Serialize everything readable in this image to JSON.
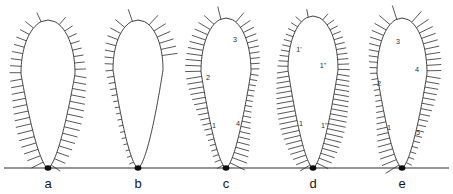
{
  "figure": {
    "width": 453,
    "height": 194,
    "background_color": "#ffffff",
    "line_color": "#2a2a2a",
    "bristle_color": "#3a3a3a",
    "baseline_color": "#2b2b2b",
    "apex_dot_color": "#0d0d0d",
    "baseline": {
      "y": 168,
      "x_start": 4,
      "x_end": 449
    }
  },
  "panels": [
    {
      "id": "a",
      "letter": "a",
      "letter_x": 48,
      "letter_y": 188,
      "apex_x": 48,
      "apex_y": 168,
      "top_y": 20,
      "max_half_width": 27,
      "belly_y": 74,
      "bristle_count": 46,
      "bristle_start_t": 0.02,
      "bristle_end_t": 0.99,
      "bristle_len_min": 9,
      "bristle_len_max": 15,
      "labels": []
    },
    {
      "id": "b",
      "letter": "b",
      "letter_x": 138,
      "letter_y": 188,
      "apex_x": 138,
      "apex_y": 168,
      "top_y": 20,
      "max_half_width": 25,
      "belly_y": 70,
      "bristle_count": 30,
      "bristle_start_t": 0.02,
      "bristle_end_t": 0.62,
      "bristle_len_min": 6,
      "bristle_len_max": 16,
      "labels": []
    },
    {
      "id": "c",
      "letter": "c",
      "letter_x": 226,
      "letter_y": 188,
      "apex_x": 226,
      "apex_y": 168,
      "top_y": 18,
      "max_half_width": 25,
      "belly_y": 72,
      "bristle_count": 58,
      "bristle_start_t": 0.01,
      "bristle_end_t": 1.0,
      "bristle_len_min": 7,
      "bristle_len_max": 16,
      "labels": [
        {
          "text": "1",
          "x": 214,
          "y": 128
        },
        {
          "text": "2",
          "x": 208,
          "y": 80
        },
        {
          "text": "3",
          "x": 235,
          "y": 42
        },
        {
          "text": "4",
          "x": 238,
          "y": 126
        }
      ]
    },
    {
      "id": "d",
      "letter": "d",
      "letter_x": 313,
      "letter_y": 188,
      "apex_x": 313,
      "apex_y": 168,
      "top_y": 16,
      "max_half_width": 25,
      "belly_y": 70,
      "bristle_count": 62,
      "bristle_start_t": 0.01,
      "bristle_end_t": 1.0,
      "bristle_len_min": 7,
      "bristle_len_max": 17,
      "labels": [
        {
          "text": "1",
          "x": 301,
          "y": 126
        },
        {
          "text": "1'",
          "x": 299,
          "y": 52
        },
        {
          "text": "1''",
          "x": 323,
          "y": 68
        },
        {
          "text": "1'''",
          "x": 325,
          "y": 128
        }
      ]
    },
    {
      "id": "e",
      "letter": "e",
      "letter_x": 402,
      "letter_y": 188,
      "apex_x": 402,
      "apex_y": 168,
      "top_y": 18,
      "max_half_width": 25,
      "belly_y": 74,
      "bristle_count": 56,
      "bristle_start_t": 0.01,
      "bristle_end_t": 1.0,
      "bristle_len_min": 7,
      "bristle_len_max": 16,
      "labels": [
        {
          "text": "1",
          "x": 389,
          "y": 130
        },
        {
          "text": "2",
          "x": 379,
          "y": 86
        },
        {
          "text": "3",
          "x": 398,
          "y": 44
        },
        {
          "text": "4",
          "x": 417,
          "y": 72
        },
        {
          "text": "5",
          "x": 418,
          "y": 135
        }
      ]
    }
  ]
}
